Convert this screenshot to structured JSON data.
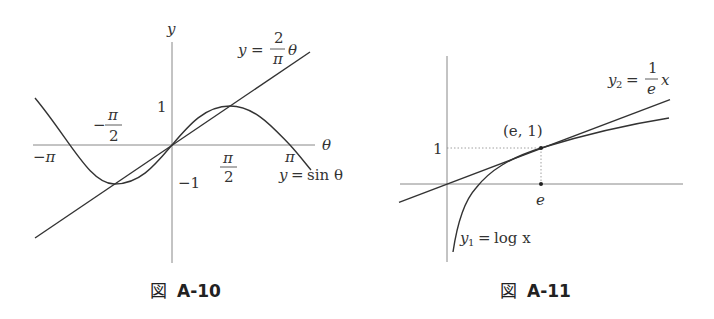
{
  "figures": [
    {
      "caption": "図 A-10",
      "caption_prefix": "図",
      "caption_id": "A-10",
      "axis_labels": {
        "x": "θ",
        "y": "y"
      },
      "tick_labels": {
        "neg_pi": "−π",
        "neg_pi_over_2_num": "π",
        "neg_pi_over_2_den": "2",
        "neg_sign": "−",
        "pi_over_2_num": "π",
        "pi_over_2_den": "2",
        "pi": "π",
        "one": "1",
        "neg_one": "−1"
      },
      "curves": [
        {
          "name": "y = sin θ",
          "label_lhs": "y",
          "label_eq": "=",
          "label_rhs": "sin θ"
        },
        {
          "name": "y = (2/π)θ",
          "label_lhs": "y",
          "label_eq": "=",
          "frac_num": "2",
          "frac_den": "π",
          "label_var": "θ"
        }
      ]
    },
    {
      "caption": "図 A-11",
      "caption_prefix": "図",
      "caption_id": "A-11",
      "tick_labels": {
        "one": "1",
        "e": "e"
      },
      "point_label": "(e, 1)",
      "curves": [
        {
          "name": "y1 = log x",
          "label_lhs": "y",
          "label_sub": "1",
          "label_eq": "=",
          "label_rhs": "log x"
        },
        {
          "name": "y2 = (1/e)x",
          "label_lhs": "y",
          "label_sub": "2",
          "label_eq": "=",
          "frac_num": "1",
          "frac_den": "e",
          "label_var": "x"
        }
      ]
    }
  ],
  "colors": {
    "axis": "#888888",
    "curve": "#333333",
    "text": "#333333"
  }
}
